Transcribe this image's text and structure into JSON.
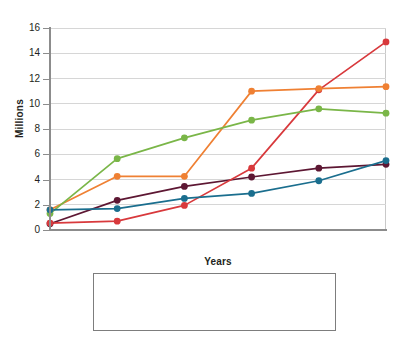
{
  "chart_data": {
    "type": "line",
    "title": "",
    "subtitle": "",
    "xlabel": "Years",
    "ylabel": "Millions",
    "categories": [
      "1939",
      "1940",
      "1941",
      "1942",
      "1943",
      "1944"
    ],
    "x": [
      1939,
      1940,
      1941,
      1942,
      1943,
      1944
    ],
    "xlim": [
      1939,
      1944
    ],
    "ylim": [
      0,
      16
    ],
    "y_ticks": [
      0,
      2,
      4,
      6,
      8,
      10,
      12,
      14,
      16
    ],
    "x_ticks": [
      "1939",
      "1940",
      "1941",
      "1942",
      "1943",
      "1944"
    ],
    "grid": "horizontal",
    "legend_position": "bottom",
    "markers": "circle",
    "series": [
      {
        "name": "United Kingdom",
        "color": "#5d1733",
        "values": [
          0.5,
          2.35,
          3.45,
          4.2,
          4.9,
          5.2
        ]
      },
      {
        "name": "United States",
        "color": "#d8393c",
        "values": [
          0.55,
          0.7,
          1.95,
          4.9,
          11.1,
          14.9
        ]
      },
      {
        "name": "Soviet Union",
        "color": "#ef8033",
        "values": [
          1.6,
          4.25,
          4.25,
          11.0,
          11.2,
          11.35
        ]
      },
      {
        "name": "Germany",
        "color": "#7ab648",
        "values": [
          1.3,
          5.65,
          7.3,
          8.7,
          9.6,
          9.25
        ]
      },
      {
        "name": "Japan",
        "color": "#1a6e8e",
        "values": [
          1.6,
          1.7,
          2.5,
          2.9,
          3.9,
          5.5
        ]
      }
    ]
  },
  "legend": {
    "entries": [
      {
        "label": "United Kingdom",
        "color": "#5d1733",
        "icon": "line-marker-icon"
      },
      {
        "label": "United States",
        "color": "#d8393c",
        "icon": "line-marker-icon"
      },
      {
        "label": "Soviet Union",
        "color": "#ef8033",
        "icon": "line-marker-icon"
      },
      {
        "label": "Germany",
        "color": "#7ab648",
        "icon": "line-marker-icon"
      },
      {
        "label": "Japan",
        "color": "#1a6e8e",
        "icon": "line-marker-icon"
      }
    ]
  },
  "axes": {
    "y_title": "Millions",
    "x_title": "Years",
    "y_tick_labels": [
      "16",
      "14",
      "12",
      "10",
      "8",
      "6",
      "4",
      "2",
      "0"
    ],
    "x_tick_labels": [
      "1939",
      "1940",
      "1941",
      "1942",
      "1943",
      "1944"
    ]
  },
  "colors": {
    "axis": "#8c8c8c",
    "grid": "#d6d6d6",
    "text": "#231f20",
    "frame": "#c9c9c9",
    "legend_border": "#7d7d7d",
    "background": "#ffffff"
  }
}
